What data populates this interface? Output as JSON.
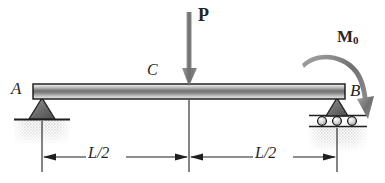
{
  "figure": {
    "type": "engineering-free-body-diagram",
    "width": 385,
    "height": 183,
    "background_color": "#ffffff",
    "ink_color": "#262626"
  },
  "labels": {
    "support_a": "A",
    "support_b": "B",
    "midspan_c": "C",
    "point_load": "P",
    "moment_symbol": "M",
    "moment_subscript": "0",
    "dim_left": "L/2",
    "dim_right": "L/2"
  },
  "beam": {
    "left_x": 33,
    "right_x": 345,
    "top_y": 84,
    "bottom_y": 99,
    "gradient_top_color": "#f2f2f2",
    "gradient_mid_color": "#6e6e6e",
    "gradient_bottom_color": "#d8d8d8",
    "outline_color": "#1a1a1a"
  },
  "supports": {
    "left": {
      "kind": "pin-support",
      "x": 42,
      "triangle_top_y": 99,
      "triangle_base_y": 119,
      "triangle_half_width": 14,
      "ground_line_x1": 14,
      "ground_line_x2": 70,
      "ground_line_y": 119,
      "hatch_color": "#b4b4b4"
    },
    "right": {
      "kind": "roller-support",
      "x": 337,
      "triangle_top_y": 99,
      "triangle_base_y": 116,
      "triangle_half_width": 12,
      "roller_count": 3,
      "roller_radius": 4,
      "roller_center_y": 121,
      "plate_top_y": 116,
      "plate_bottom_y": 126,
      "ground_line_x1": 310,
      "ground_line_x2": 366,
      "hatch_color": "#b4b4b4"
    }
  },
  "loads": {
    "point_load": {
      "name": "P",
      "x": 189,
      "tail_y": 12,
      "head_y": 86,
      "direction": "down",
      "shaft_width": 5,
      "fill_color": "#7d7d7d"
    },
    "moment": {
      "name": "M0",
      "sense": "clockwise",
      "arc_start_x": 303,
      "arc_start_y": 62,
      "arc_end_x": 369,
      "arc_end_y": 104,
      "head_tip_x": 370,
      "head_tip_y": 118,
      "fill_color": "#7d7d7d"
    }
  },
  "dimensions": {
    "line_y": 157,
    "left": {
      "label": "L/2",
      "from_x": 42,
      "to_x": 189,
      "tick_x": 42
    },
    "right": {
      "label": "L/2",
      "from_x": 189,
      "to_x": 337,
      "tick_x": 337
    },
    "center_tick": {
      "x": 189,
      "top_y": 99,
      "bottom_y": 170
    },
    "extension_left": {
      "x": 42,
      "top_y": 119,
      "bottom_y": 170
    },
    "extension_right": {
      "x": 337,
      "top_y": 126,
      "bottom_y": 170
    }
  }
}
